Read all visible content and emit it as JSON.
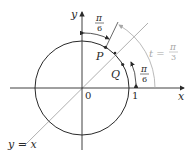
{
  "figure": {
    "axes": {
      "x_label": "x",
      "y_label": "y",
      "origin_label": "0",
      "one_label": "1"
    },
    "line": {
      "label": "y = x"
    },
    "points": [
      {
        "label": "P",
        "angle_deg": 60
      },
      {
        "label": "Q",
        "angle_deg": 30
      }
    ],
    "angles": {
      "top_fraction": {
        "num": "π",
        "den": "6"
      },
      "right_fraction": {
        "num": "π",
        "den": "6"
      },
      "t_label": {
        "lhs": "t =",
        "num": "π",
        "den": "3"
      }
    },
    "colors": {
      "ink": "#2a2a2a",
      "gray": "#a8a8a8",
      "background": "#ffffff"
    }
  }
}
